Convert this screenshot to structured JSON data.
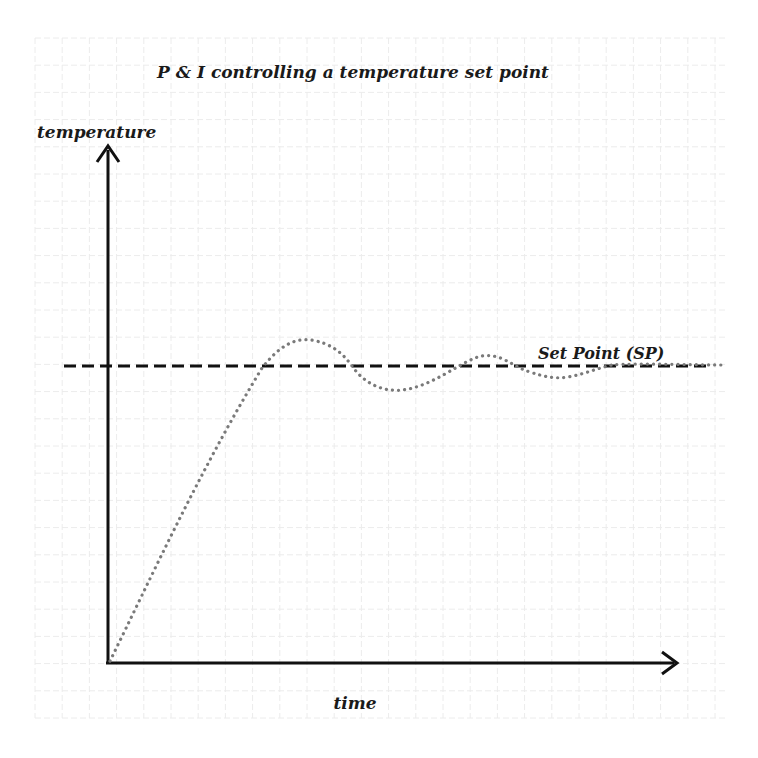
{
  "title": "P & I controlling a temperature set point",
  "y_axis_label": "temperature",
  "x_axis_label": "time",
  "setpoint_label": "Set Point (SP)",
  "colors": {
    "axis": "#111111",
    "setpoint_line": "#111111",
    "response_curve": "#7a7a7a",
    "grid": "#ececec",
    "text": "#1a1a1a"
  },
  "chart_data": {
    "type": "line",
    "title": "P & I controlling a temperature set point",
    "xlabel": "time",
    "ylabel": "temperature",
    "grid": true,
    "axis_ticks": "none",
    "series": [
      {
        "name": "Set Point (SP)",
        "style": "dashed",
        "x": [
          0,
          1
        ],
        "y": [
          1.0,
          1.0
        ]
      },
      {
        "name": "temperature response",
        "style": "dotted",
        "x": [
          0.0,
          0.14,
          0.27,
          0.35,
          0.42,
          0.51,
          0.6,
          0.67,
          0.72,
          0.79,
          0.86,
          0.93,
          1.0
        ],
        "y": [
          0.0,
          0.52,
          1.0,
          1.09,
          1.0,
          0.92,
          0.99,
          1.03,
          0.98,
          0.96,
          1.0,
          1.0,
          1.0
        ]
      }
    ],
    "annotations": [
      "Set Point (SP)"
    ]
  }
}
